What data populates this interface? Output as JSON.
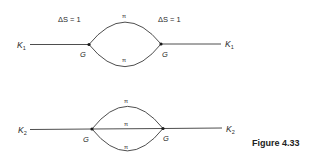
{
  "figure": {
    "caption": "Figure 4.33",
    "diagrams": [
      {
        "id": "k1-two-pion-loop",
        "external_left": {
          "base": "K",
          "sub": "1"
        },
        "external_right": {
          "base": "K",
          "sub": "1"
        },
        "vertex_left": "G",
        "vertex_right": "G",
        "annotation_left": "ΔS = 1",
        "annotation_right": "ΔS = 1",
        "internal_lines": [
          "π",
          "π"
        ]
      },
      {
        "id": "k2-three-pion-loop",
        "external_left": {
          "base": "K",
          "sub": "2"
        },
        "external_right": {
          "base": "K",
          "sub": "2"
        },
        "vertex_left": "G",
        "vertex_right": "G",
        "internal_lines": [
          "π",
          "π",
          "π"
        ]
      }
    ]
  },
  "colors": {
    "line": "#3a3a3a",
    "text": "#2a2a2a",
    "background": "#ffffff"
  }
}
